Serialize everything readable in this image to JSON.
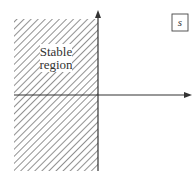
{
  "diagram": {
    "region_label_line1": "Stable",
    "region_label_line2": "region",
    "plane_label": "s",
    "colors": {
      "axis": "#333333",
      "hatch": "#555555",
      "background": "#ffffff",
      "label_bg": "#ffffff"
    }
  }
}
